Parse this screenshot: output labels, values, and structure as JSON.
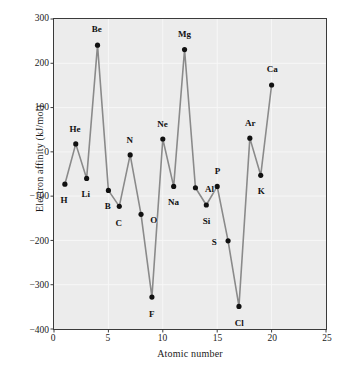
{
  "figure": {
    "background_color": "#ffffff",
    "plot_background_color": "#ececec",
    "gridline_color": "#f7f7f7",
    "axis_color": "#3a3a3a",
    "line_color": "#8a8a8a",
    "marker_color": "#111111"
  },
  "chart_data": {
    "type": "line",
    "title": "",
    "subtitle": "",
    "xlabel": "Atomic number",
    "ylabel": "Electron affinity (kJ/mol)",
    "xlim": [
      0,
      25
    ],
    "ylim": [
      -400,
      300
    ],
    "xticks": [
      0,
      5,
      10,
      15,
      20,
      25
    ],
    "yticks": [
      300,
      200,
      100,
      0,
      -100,
      -200,
      -300,
      -400
    ],
    "xtick_labels": [
      "0",
      "5",
      "10",
      "15",
      "20",
      "25"
    ],
    "ytick_labels": [
      "300",
      "200",
      "100",
      "0",
      "−100",
      "−200",
      "−300",
      "−400"
    ],
    "grid": true,
    "legend": "none",
    "marker": "filled-circle",
    "series": [
      {
        "name": "Electron affinity",
        "x": [
          1,
          2,
          3,
          4,
          5,
          6,
          7,
          8,
          9,
          10,
          11,
          12,
          13,
          14,
          15,
          16,
          17,
          18,
          19,
          20
        ],
        "values": [
          -73,
          18,
          -60,
          241,
          -87,
          -123,
          -7,
          -141,
          -328,
          29,
          -78,
          231,
          -81,
          -120,
          -78,
          -201,
          -349,
          31,
          -53,
          151
        ],
        "point_labels": [
          "H",
          "He",
          "Li",
          "Be",
          "B",
          "C",
          "N",
          "O",
          "F",
          "Ne",
          "Na",
          "Mg",
          "Al",
          "Si",
          "P",
          "S",
          "Cl",
          "Ar",
          "K",
          "Ca"
        ],
        "label_offsets": [
          [
            0,
            16
          ],
          [
            0,
            -15
          ],
          [
            0,
            16
          ],
          [
            0,
            -15
          ],
          [
            0,
            16
          ],
          [
            0,
            16
          ],
          [
            0,
            -15
          ],
          [
            13,
            5
          ],
          [
            0,
            16
          ],
          [
            0,
            -15
          ],
          [
            0,
            16
          ],
          [
            0,
            -15
          ],
          [
            14,
            1
          ],
          [
            0,
            16
          ],
          [
            0,
            -15
          ],
          [
            -14,
            1
          ],
          [
            0,
            16
          ],
          [
            0,
            -15
          ],
          [
            0,
            16
          ],
          [
            0,
            -15
          ]
        ]
      }
    ]
  }
}
